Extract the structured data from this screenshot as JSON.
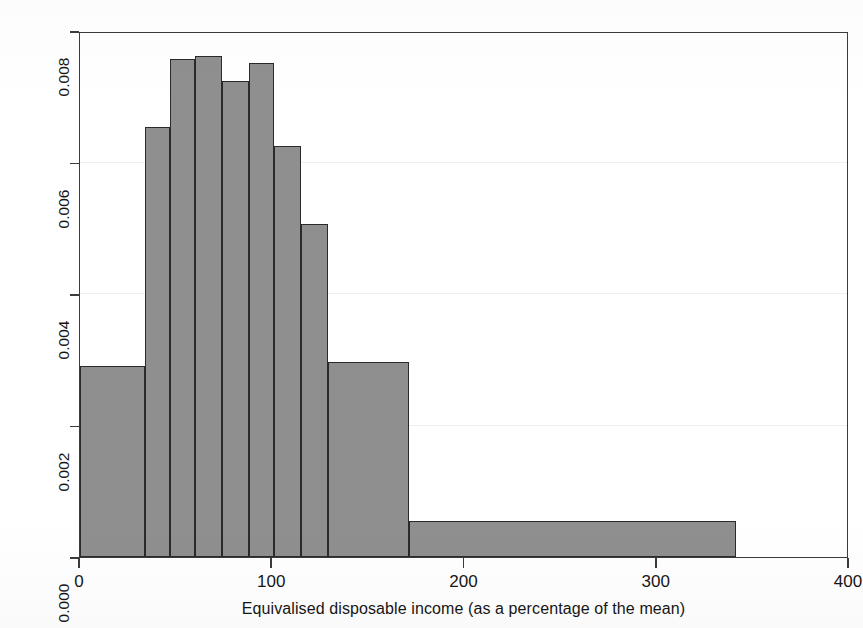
{
  "chart_data": {
    "type": "bar",
    "subtype": "histogram",
    "title": "",
    "xlabel": "Equivalised disposable income (as a percentage of the mean)",
    "ylabel": "Density",
    "xlim": [
      0,
      400
    ],
    "ylim": [
      0.0,
      0.008
    ],
    "xticks": [
      0,
      100,
      200,
      300,
      400
    ],
    "xticklabels": [
      "0",
      "100",
      "200",
      "300",
      "400"
    ],
    "yticks": [
      0.0,
      0.002,
      0.004,
      0.006,
      0.008
    ],
    "yticklabels": [
      "0.000",
      "0.002",
      "0.004",
      "0.006",
      "0.008"
    ],
    "grid": true,
    "legend": false,
    "bar_fill_color": "#8f8f8f",
    "bar_edge_color": "#2a2a2a",
    "axis_color": "#3b3b3b",
    "bins": [
      {
        "x0": 0,
        "x1": 34,
        "density": 0.0029
      },
      {
        "x0": 34,
        "x1": 47,
        "density": 0.00654
      },
      {
        "x0": 47,
        "x1": 60,
        "density": 0.00757
      },
      {
        "x0": 60,
        "x1": 74,
        "density": 0.00762
      },
      {
        "x0": 74,
        "x1": 88,
        "density": 0.00724
      },
      {
        "x0": 88,
        "x1": 101,
        "density": 0.00751
      },
      {
        "x0": 101,
        "x1": 115,
        "density": 0.00625
      },
      {
        "x0": 115,
        "x1": 129,
        "density": 0.00506
      },
      {
        "x0": 129,
        "x1": 171,
        "density": 0.00297
      },
      {
        "x0": 171,
        "x1": 341,
        "density": 0.00055
      }
    ]
  }
}
